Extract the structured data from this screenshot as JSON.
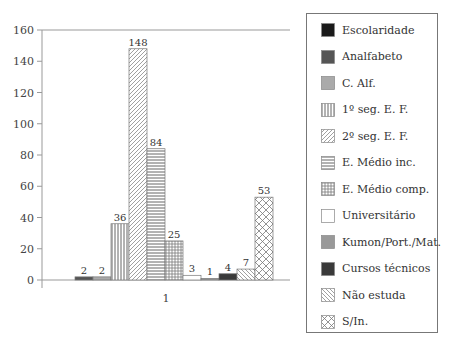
{
  "chart_data": {
    "type": "bar",
    "title": "",
    "xlabel": "",
    "ylabel": "",
    "categories": [
      "1"
    ],
    "ylim": [
      0,
      160
    ],
    "yticks": [
      0,
      20,
      40,
      60,
      80,
      100,
      120,
      140,
      160
    ],
    "grid": false,
    "legend_position": "right",
    "series": [
      {
        "name": "Escolaridade",
        "values": [
          0
        ],
        "label": "",
        "fill": "#1a1a1a",
        "pattern": "solid"
      },
      {
        "name": "Analfabeto",
        "values": [
          2
        ],
        "label": "2",
        "fill": "#555555",
        "pattern": "solid"
      },
      {
        "name": "C. Alf.",
        "values": [
          2
        ],
        "label": "2",
        "fill": "#aaaaaa",
        "pattern": "solid"
      },
      {
        "name": "1º seg. E. F.",
        "values": [
          36
        ],
        "label": "36",
        "fill": "#ffffff",
        "pattern": "vertical"
      },
      {
        "name": "2º seg. E. F.",
        "values": [
          148
        ],
        "label": "148",
        "fill": "#ffffff",
        "pattern": "diagonal"
      },
      {
        "name": "E. Médio inc.",
        "values": [
          84
        ],
        "label": "84",
        "fill": "#ffffff",
        "pattern": "horizontal"
      },
      {
        "name": "E. Médio comp.",
        "values": [
          25
        ],
        "label": "25",
        "fill": "#ffffff",
        "pattern": "grid"
      },
      {
        "name": "Universitário",
        "values": [
          3
        ],
        "label": "3",
        "fill": "#ffffff",
        "pattern": "solid"
      },
      {
        "name": "Kumon/Port./Mat.",
        "values": [
          1
        ],
        "label": "1",
        "fill": "#999999",
        "pattern": "solid"
      },
      {
        "name": "Cursos técnicos",
        "values": [
          4
        ],
        "label": "4",
        "fill": "#3a3a3a",
        "pattern": "solid"
      },
      {
        "name": "Não estuda",
        "values": [
          7
        ],
        "label": "7",
        "fill": "#ffffff",
        "pattern": "backdiagonal"
      },
      {
        "name": "S/In.",
        "values": [
          53
        ],
        "label": "53",
        "fill": "#ffffff",
        "pattern": "crosshatch"
      }
    ]
  },
  "legend": {
    "items": [
      {
        "label": "Escolaridade"
      },
      {
        "label": "Analfabeto"
      },
      {
        "label": "C. Alf."
      },
      {
        "label": "1º seg. E. F."
      },
      {
        "label": "2º seg. E. F."
      },
      {
        "label": "E. Médio inc."
      },
      {
        "label": "E. Médio comp."
      },
      {
        "label": "Universitário"
      },
      {
        "label": "Kumon/Port./Mat."
      },
      {
        "label": "Cursos técnicos"
      },
      {
        "label": "Não estuda"
      },
      {
        "label": "S/In."
      }
    ]
  }
}
